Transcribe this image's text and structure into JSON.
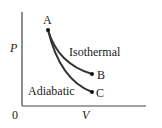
{
  "diagram": {
    "type": "P-V diagram",
    "axes": {
      "y_label": "P",
      "x_label": "V",
      "origin_label": "0"
    },
    "points": [
      {
        "id": "A",
        "label": "A"
      },
      {
        "id": "B",
        "label": "B"
      },
      {
        "id": "C",
        "label": "C"
      }
    ],
    "curves": [
      {
        "from": "A",
        "to": "B",
        "label": "Isothermal"
      },
      {
        "from": "A",
        "to": "C",
        "label": "Adiabatic"
      }
    ],
    "colors": {
      "line": "#333333",
      "text": "#222222"
    }
  }
}
